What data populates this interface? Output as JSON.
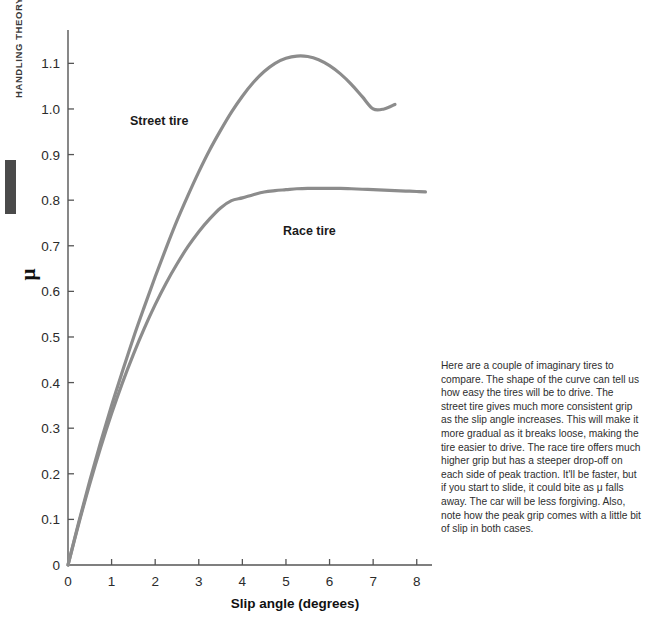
{
  "page": {
    "running_head": "HANDLING THEORY"
  },
  "chart_data": {
    "type": "line",
    "title": "",
    "xlabel": "Slip angle (degrees)",
    "ylabel": "μ",
    "xlim": [
      0,
      8.35
    ],
    "ylim": [
      0,
      1.16
    ],
    "grid": false,
    "legend_position": "inline-annotations",
    "xticks": [
      "0",
      "1",
      "2",
      "3",
      "4",
      "5",
      "6",
      "7",
      "8"
    ],
    "xtick_values": [
      0,
      1,
      2,
      3,
      4,
      5,
      6,
      7,
      8
    ],
    "yticks": [
      "0",
      "0.1",
      "0.2",
      "0.3",
      "0.4",
      "0.5",
      "0.6",
      "0.7",
      "0.8",
      "0.9",
      "1.0",
      "1.1"
    ],
    "ytick_values": [
      0,
      0.1,
      0.2,
      0.3,
      0.4,
      0.5,
      0.6,
      0.7,
      0.8,
      0.9,
      1.0,
      1.1
    ],
    "line_color": "#8c8c8c",
    "axis_color": "#555555",
    "series": [
      {
        "name": "Street tire",
        "label": "Street tire",
        "x": [
          0.0,
          0.25,
          0.5,
          0.75,
          1.0,
          1.25,
          1.5,
          1.75,
          2.0,
          2.25,
          2.5,
          2.75,
          3.0,
          3.25,
          3.5,
          3.75,
          4.0,
          4.25,
          4.5,
          4.75,
          5.0,
          5.25,
          5.5,
          5.75,
          6.0,
          6.25,
          6.5,
          6.75,
          7.0,
          7.25,
          7.5
        ],
        "values": [
          0.0,
          0.095,
          0.185,
          0.27,
          0.35,
          0.425,
          0.498,
          0.566,
          0.632,
          0.695,
          0.755,
          0.81,
          0.862,
          0.91,
          0.953,
          0.993,
          1.028,
          1.058,
          1.082,
          1.1,
          1.111,
          1.116,
          1.115,
          1.108,
          1.095,
          1.077,
          1.054,
          1.027,
          1.0,
          1.0,
          1.01
        ]
      },
      {
        "name": "Race tire",
        "label": "Race tire",
        "x": [
          0.0,
          0.25,
          0.5,
          0.75,
          1.0,
          1.25,
          1.5,
          1.75,
          2.0,
          2.25,
          2.5,
          2.75,
          3.0,
          3.25,
          3.5,
          3.75,
          4.0,
          4.25,
          4.5,
          4.75,
          5.0,
          5.25,
          5.5,
          5.75,
          6.0,
          6.25,
          6.5,
          6.75,
          7.0,
          7.25,
          7.5,
          7.75,
          8.0,
          8.2
        ],
        "values": [
          0.0,
          0.092,
          0.178,
          0.258,
          0.332,
          0.4,
          0.462,
          0.519,
          0.571,
          0.618,
          0.66,
          0.698,
          0.731,
          0.759,
          0.783,
          0.799,
          0.805,
          0.812,
          0.818,
          0.821,
          0.823,
          0.825,
          0.826,
          0.826,
          0.826,
          0.826,
          0.825,
          0.824,
          0.823,
          0.822,
          0.821,
          0.82,
          0.819,
          0.818
        ]
      }
    ],
    "annotations": [
      {
        "name": "street-tire-label",
        "text": "Street tire",
        "x": 1.45,
        "y": 0.905
      },
      {
        "name": "race-tire-label",
        "text": "Race tire",
        "x": 4.55,
        "y": 0.695
      }
    ]
  },
  "note": {
    "text": "Here are a couple of imaginary tires to compare. The shape of the curve can tell us how easy the tires will be to drive. The street tire gives much more consistent grip as the slip angle increases. This will make it more gradual as it breaks loose, making the tire easier to drive. The race tire offers much higher grip but has a steeper drop-off on each side of peak traction. It'll be faster, but if you start to slide, it could bite as μ falls away. The car will be less forgiving. Also, note how the peak grip comes with a little bit of slip in both cases."
  }
}
